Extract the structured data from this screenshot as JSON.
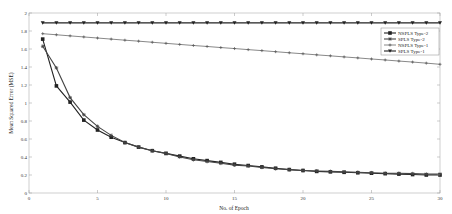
{
  "chart_data": {
    "type": "line",
    "title": "",
    "xlabel": "No. of Epoch",
    "ylabel": "Mean Squared Error (MSE)",
    "xlim": [
      0,
      30
    ],
    "ylim": [
      0,
      2
    ],
    "xticks": [
      0,
      5,
      10,
      15,
      20,
      25,
      30
    ],
    "yticks": [
      0,
      0.2,
      0.4,
      0.6,
      0.8,
      1,
      1.2,
      1.4,
      1.6,
      1.8,
      2
    ],
    "grid": false,
    "legend_position": "upper right",
    "x": [
      1,
      2,
      3,
      4,
      5,
      6,
      7,
      8,
      9,
      10,
      11,
      12,
      13,
      14,
      15,
      16,
      17,
      18,
      19,
      20,
      21,
      22,
      23,
      24,
      25,
      26,
      27,
      28,
      29,
      30
    ],
    "series": [
      {
        "name": "NSPLS Type-2",
        "marker": "square",
        "color": "#222222",
        "values": [
          1.71,
          1.19,
          1.01,
          0.81,
          0.7,
          0.62,
          0.56,
          0.51,
          0.47,
          0.44,
          0.41,
          0.38,
          0.36,
          0.34,
          0.32,
          0.305,
          0.29,
          0.275,
          0.26,
          0.25,
          0.24,
          0.235,
          0.23,
          0.225,
          0.22,
          0.215,
          0.21,
          0.205,
          0.2,
          0.2
        ]
      },
      {
        "name": "SPLS Type-2",
        "marker": "plus",
        "color": "#444444",
        "values": [
          1.63,
          1.39,
          1.06,
          0.87,
          0.74,
          0.64,
          0.56,
          0.51,
          0.47,
          0.44,
          0.4,
          0.37,
          0.35,
          0.33,
          0.31,
          0.3,
          0.285,
          0.27,
          0.26,
          0.25,
          0.245,
          0.24,
          0.235,
          0.23,
          0.225,
          0.22,
          0.22,
          0.215,
          0.21,
          0.21
        ]
      },
      {
        "name": "NSPLS Type-1",
        "marker": "dot",
        "color": "#555555",
        "values": [
          1.77,
          1.758,
          1.746,
          1.734,
          1.722,
          1.71,
          1.698,
          1.687,
          1.675,
          1.663,
          1.651,
          1.639,
          1.628,
          1.616,
          1.605,
          1.593,
          1.582,
          1.57,
          1.558,
          1.547,
          1.535,
          1.524,
          1.512,
          1.501,
          1.489,
          1.478,
          1.466,
          1.455,
          1.443,
          1.43
        ]
      },
      {
        "name": "SPLS Type-1",
        "marker": "triangle-down",
        "color": "#222222",
        "values": [
          1.89,
          1.89,
          1.89,
          1.89,
          1.89,
          1.89,
          1.89,
          1.89,
          1.89,
          1.89,
          1.89,
          1.89,
          1.89,
          1.89,
          1.89,
          1.89,
          1.89,
          1.89,
          1.89,
          1.89,
          1.89,
          1.89,
          1.89,
          1.89,
          1.89,
          1.89,
          1.89,
          1.89,
          1.89,
          1.89
        ]
      }
    ]
  }
}
